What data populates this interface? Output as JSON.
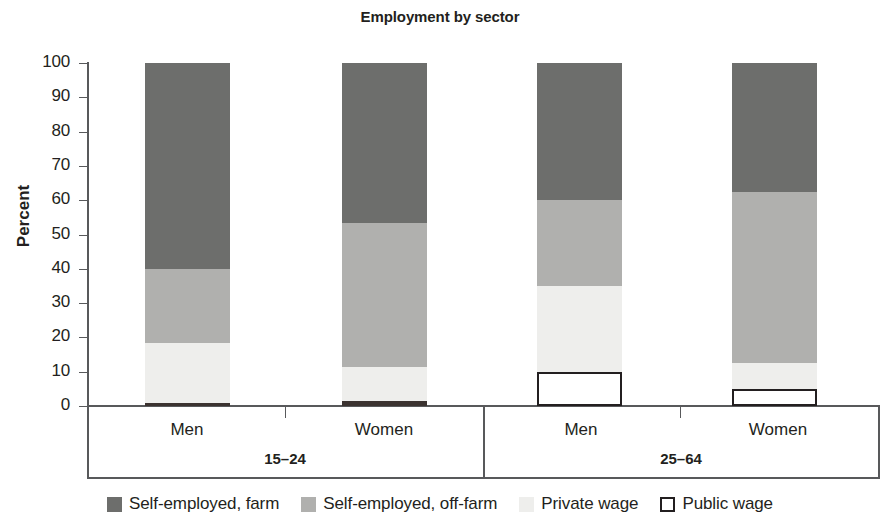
{
  "chart_data": {
    "type": "bar",
    "title": "Employment by sector",
    "subtype": "stacked-bar-100",
    "xlabel": "",
    "ylabel": "Percent",
    "ylim": [
      0,
      100
    ],
    "yticks": [
      0,
      10,
      20,
      30,
      40,
      50,
      60,
      70,
      80,
      90,
      100
    ],
    "grid": false,
    "legend_position": "bottom",
    "categories": [
      "Men",
      "Women",
      "Men",
      "Women"
    ],
    "groups": [
      {
        "label": "15–24",
        "categories": [
          "Men",
          "Women"
        ]
      },
      {
        "label": "25–64",
        "categories": [
          "Men",
          "Women"
        ]
      }
    ],
    "series": [
      {
        "name": "Self-employed, farm",
        "color": "#6d6e6c",
        "values": [
          60,
          46,
          40,
          38
        ]
      },
      {
        "name": "Self-employed, off-farm",
        "color": "#b0b0ae",
        "values": [
          21,
          41,
          25,
          50
        ]
      },
      {
        "name": "Private wage",
        "color": "#eeeeec",
        "values": [
          18,
          10,
          25,
          7
        ]
      },
      {
        "name": "Public wage",
        "color": "#ffffff",
        "values": [
          1,
          2,
          10,
          5
        ]
      }
    ],
    "stack_order_bottom_to_top": [
      "Public wage",
      "Private wage",
      "Self-employed, off-farm",
      "Self-employed, farm"
    ],
    "bars": [
      {
        "group": "15–24",
        "category": "Men",
        "segments": [
          {
            "name": "Public wage",
            "from": 0,
            "to": 1
          },
          {
            "name": "Private wage",
            "from": 1,
            "to": 18.5
          },
          {
            "name": "Self-employed, off-farm",
            "from": 18.5,
            "to": 40
          },
          {
            "name": "Self-employed, farm",
            "from": 40,
            "to": 100
          }
        ]
      },
      {
        "group": "15–24",
        "category": "Women",
        "segments": [
          {
            "name": "Public wage",
            "from": 0,
            "to": 1.5
          },
          {
            "name": "Private wage",
            "from": 1.5,
            "to": 11.5
          },
          {
            "name": "Self-employed, off-farm",
            "from": 11.5,
            "to": 53.5
          },
          {
            "name": "Self-employed, farm",
            "from": 53.5,
            "to": 100
          }
        ]
      },
      {
        "group": "25–64",
        "category": "Men",
        "segments": [
          {
            "name": "Public wage",
            "from": 0,
            "to": 10
          },
          {
            "name": "Private wage",
            "from": 10,
            "to": 35
          },
          {
            "name": "Self-employed, off-farm",
            "from": 35,
            "to": 60
          },
          {
            "name": "Self-employed, farm",
            "from": 60,
            "to": 100
          }
        ]
      },
      {
        "group": "25–64",
        "category": "Women",
        "segments": [
          {
            "name": "Public wage",
            "from": 0,
            "to": 5
          },
          {
            "name": "Private wage",
            "from": 5,
            "to": 12.5
          },
          {
            "name": "Self-employed, off-farm",
            "from": 12.5,
            "to": 62.5
          },
          {
            "name": "Self-employed, farm",
            "from": 62.5,
            "to": 100
          }
        ]
      }
    ]
  },
  "axis": {
    "y_title": "Percent",
    "y_labels": [
      "100",
      "90",
      "80",
      "70",
      "60",
      "50",
      "40",
      "30",
      "20",
      "10",
      "0"
    ]
  },
  "categories": {
    "c0": "Men",
    "c1": "Women",
    "c2": "Men",
    "c3": "Women"
  },
  "groups": {
    "g0": "15–24",
    "g1": "25–64"
  },
  "legend": {
    "items": [
      {
        "label": "Self-employed, farm",
        "color": "#6d6e6c",
        "border": "none"
      },
      {
        "label": "Self-employed, off-farm",
        "color": "#b0b0ae",
        "border": "none"
      },
      {
        "label": "Private wage",
        "color": "#eeeeec",
        "border": "none"
      },
      {
        "label": "Public wage",
        "color": "#ffffff",
        "border": "#231f20"
      }
    ]
  },
  "title": "Employment by sector"
}
